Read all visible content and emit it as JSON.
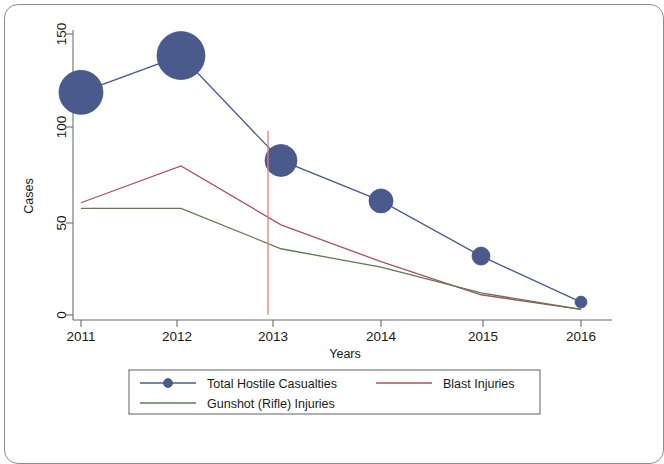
{
  "chart_data": {
    "type": "line",
    "title": "",
    "subtitle": "",
    "xlabel": "Years",
    "ylabel": "Cases",
    "categories": [
      "2011",
      "2012",
      "2013",
      "2014",
      "2015",
      "2016"
    ],
    "x": [
      2011,
      2012,
      2013,
      2014,
      2015,
      2016
    ],
    "xlim": [
      2010.75,
      2016.25
    ],
    "ylim": [
      0,
      158
    ],
    "yticks": [
      0,
      50,
      100,
      150
    ],
    "ytick_labels": [
      "0",
      "50",
      "100",
      "150"
    ],
    "xticks": [
      2011,
      2012,
      2013,
      2014,
      2015,
      2016
    ],
    "xtick_labels": [
      "2011",
      "2012",
      "2013",
      "2014",
      "2015",
      "2016"
    ],
    "grid": false,
    "legend_position": "bottom",
    "series": [
      {
        "name": "Total Hostile Casualties",
        "color": "#4a5a8c",
        "marker": "circle-sized",
        "style": "line-marker",
        "values": [
          121,
          141,
          84,
          62,
          32,
          7
        ],
        "marker_sizes": [
          22,
          24,
          16,
          12,
          9,
          6
        ]
      },
      {
        "name": "Blast Injuries",
        "color": "#a8525c",
        "marker": "none",
        "style": "line",
        "values": [
          61,
          81,
          49,
          29,
          11,
          3
        ]
      },
      {
        "name": "Gunshot (Rifle) Injuries",
        "color": "#5f7a52",
        "marker": "none",
        "style": "line",
        "values": [
          58,
          58,
          36,
          26,
          12,
          3
        ]
      }
    ],
    "annotations": [
      {
        "type": "vertical-line",
        "name": "intervention-marker",
        "x": 2012.87,
        "color": "#ef7b6e",
        "y_from": 0,
        "y_to": 100
      }
    ]
  },
  "legend": {
    "entries": [
      {
        "label": "Total Hostile Casualties",
        "color": "#4a5a8c",
        "has_marker": true
      },
      {
        "label": "Blast Injuries",
        "color": "#a8525c",
        "has_marker": false
      },
      {
        "label": "Gunshot (Rifle) Injuries",
        "color": "#5f7a52",
        "has_marker": false
      }
    ]
  }
}
